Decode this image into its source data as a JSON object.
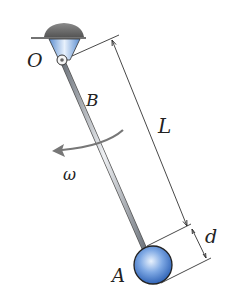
{
  "diagram": {
    "labels": {
      "pivot": "O",
      "point_b": "B",
      "ball": "A",
      "length": "L",
      "diameter": "d",
      "angular_velocity": "ω"
    },
    "colors": {
      "support": "#6b6b6b",
      "bracket": "#8fb3e0",
      "rod": "#9a9fa6",
      "ball": "#3f7ccf",
      "dimension": "#333333"
    }
  }
}
